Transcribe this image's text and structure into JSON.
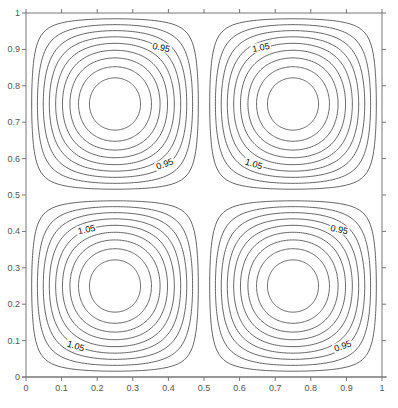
{
  "chart_data": {
    "type": "contour",
    "title": "",
    "xlabel": "",
    "ylabel": "",
    "xlim": [
      0,
      1
    ],
    "ylim": [
      0,
      1
    ],
    "grid": false,
    "legend": null,
    "x_ticks": [
      "0",
      "0.1",
      "0.2",
      "0.3",
      "0.4",
      "0.5",
      "0.6",
      "0.7",
      "0.8",
      "0.9",
      "1"
    ],
    "y_ticks": [
      "0",
      "0.1",
      "0.2",
      "0.3",
      "0.4",
      "0.5",
      "0.6",
      "0.7",
      "0.8",
      "0.9",
      "1"
    ],
    "field_description": "f(x,y) = 1 - 0.1*sin(2*pi*x)*sin(2*pi*y); four cells with extrema at (0.25,0.75), (0.75,0.75), (0.25,0.25), (0.75,0.25)",
    "quadrants": [
      {
        "name": "top-left",
        "center": [
          0.25,
          0.75
        ],
        "extremum": "min",
        "levels": [
          0.99,
          0.98,
          0.97,
          0.96,
          0.95,
          0.94,
          0.93,
          0.92,
          0.91
        ]
      },
      {
        "name": "top-right",
        "center": [
          0.75,
          0.75
        ],
        "extremum": "max",
        "levels": [
          1.01,
          1.02,
          1.03,
          1.04,
          1.05,
          1.06,
          1.07,
          1.08,
          1.09
        ]
      },
      {
        "name": "bottom-left",
        "center": [
          0.25,
          0.25
        ],
        "extremum": "max",
        "levels": [
          1.01,
          1.02,
          1.03,
          1.04,
          1.05,
          1.06,
          1.07,
          1.08,
          1.09
        ]
      },
      {
        "name": "bottom-right",
        "center": [
          0.75,
          0.25
        ],
        "extremum": "min",
        "levels": [
          0.99,
          0.98,
          0.97,
          0.96,
          0.95,
          0.94,
          0.93,
          0.92,
          0.91
        ]
      }
    ],
    "contour_labels": [
      {
        "text": "0.95",
        "x": 0.38,
        "y": 0.905,
        "angle": 12
      },
      {
        "text": "0.95",
        "x": 0.39,
        "y": 0.585,
        "angle": -20
      },
      {
        "text": "1.05",
        "x": 0.66,
        "y": 0.905,
        "angle": -12
      },
      {
        "text": "1.05",
        "x": 0.64,
        "y": 0.585,
        "angle": 18
      },
      {
        "text": "1.05",
        "x": 0.17,
        "y": 0.405,
        "angle": -12
      },
      {
        "text": "1.05",
        "x": 0.14,
        "y": 0.085,
        "angle": 18
      },
      {
        "text": "0.95",
        "x": 0.88,
        "y": 0.405,
        "angle": 12
      },
      {
        "text": "0.95",
        "x": 0.89,
        "y": 0.085,
        "angle": -20
      }
    ],
    "colors": {
      "contour": "#555555",
      "axis": "#777777",
      "label": "#111111"
    }
  }
}
